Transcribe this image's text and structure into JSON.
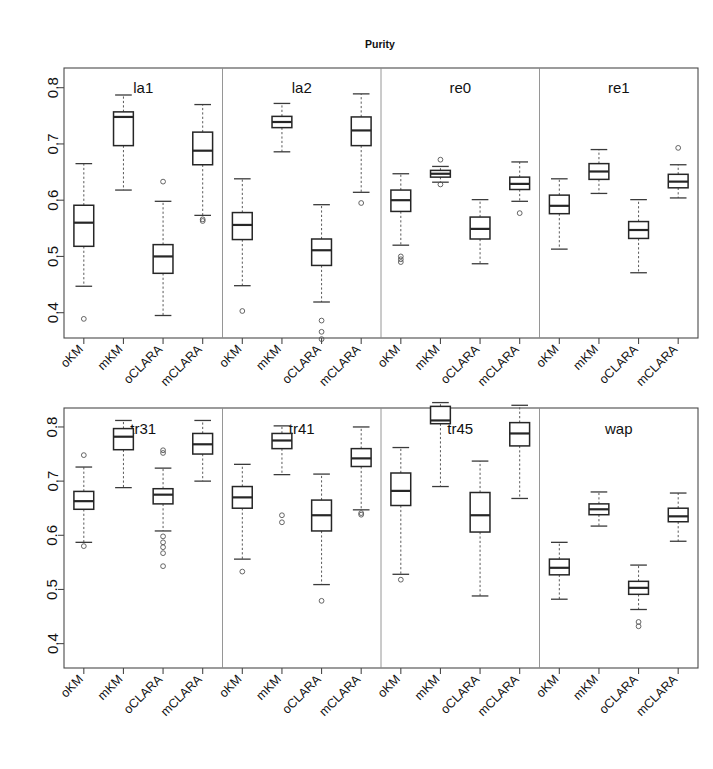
{
  "chart_data": {
    "type": "box",
    "title": "Purity",
    "xlabel": "",
    "ylabel": "",
    "ylim": [
      0.355,
      0.835
    ],
    "yticks": [
      0.4,
      0.5,
      0.6,
      0.7,
      0.8
    ],
    "ytick_labels": [
      "0.4",
      "0.5",
      "0.6",
      "0.7",
      "0.8"
    ],
    "grid": false,
    "legend": "none",
    "methods": [
      "oKM",
      "mKM",
      "oCLARA",
      "mCLARA"
    ],
    "panels": [
      {
        "row": 0,
        "groups": [
          {
            "name": "la1",
            "boxes": [
              {
                "method": "oKM",
                "whisker_low": 0.447,
                "q1": 0.518,
                "median": 0.56,
                "q3": 0.591,
                "whisker_high": 0.665,
                "outliers": [
                  0.389
                ]
              },
              {
                "method": "mKM",
                "whisker_low": 0.618,
                "q1": 0.697,
                "median": 0.748,
                "q3": 0.757,
                "whisker_high": 0.787,
                "outliers": []
              },
              {
                "method": "oCLARA",
                "whisker_low": 0.395,
                "q1": 0.47,
                "median": 0.5,
                "q3": 0.521,
                "whisker_high": 0.598,
                "outliers": [
                  0.633
                ]
              },
              {
                "method": "mCLARA",
                "whisker_low": 0.573,
                "q1": 0.663,
                "median": 0.688,
                "q3": 0.721,
                "whisker_high": 0.77,
                "outliers": [
                  0.566,
                  0.563
                ]
              }
            ]
          },
          {
            "name": "la2",
            "boxes": [
              {
                "method": "oKM",
                "whisker_low": 0.448,
                "q1": 0.53,
                "median": 0.556,
                "q3": 0.578,
                "whisker_high": 0.638,
                "outliers": [
                  0.403
                ]
              },
              {
                "method": "mKM",
                "whisker_low": 0.686,
                "q1": 0.729,
                "median": 0.739,
                "q3": 0.749,
                "whisker_high": 0.772,
                "outliers": []
              },
              {
                "method": "oCLARA",
                "whisker_low": 0.419,
                "q1": 0.484,
                "median": 0.511,
                "q3": 0.531,
                "whisker_high": 0.592,
                "outliers": [
                  0.386,
                  0.366,
                  0.353
                ]
              },
              {
                "method": "mCLARA",
                "whisker_low": 0.614,
                "q1": 0.697,
                "median": 0.724,
                "q3": 0.748,
                "whisker_high": 0.789,
                "outliers": [
                  0.595
                ]
              }
            ]
          },
          {
            "name": "re0",
            "boxes": [
              {
                "method": "oKM",
                "whisker_low": 0.52,
                "q1": 0.58,
                "median": 0.6,
                "q3": 0.618,
                "whisker_high": 0.647,
                "outliers": [
                  0.5,
                  0.495,
                  0.49
                ]
              },
              {
                "method": "mKM",
                "whisker_low": 0.632,
                "q1": 0.641,
                "median": 0.647,
                "q3": 0.653,
                "whisker_high": 0.66,
                "outliers": [
                  0.672,
                  0.628
                ]
              },
              {
                "method": "oCLARA",
                "whisker_low": 0.487,
                "q1": 0.531,
                "median": 0.549,
                "q3": 0.57,
                "whisker_high": 0.601,
                "outliers": []
              },
              {
                "method": "mCLARA",
                "whisker_low": 0.598,
                "q1": 0.619,
                "median": 0.629,
                "q3": 0.641,
                "whisker_high": 0.668,
                "outliers": [
                  0.577
                ]
              }
            ]
          },
          {
            "name": "re1",
            "boxes": [
              {
                "method": "oKM",
                "whisker_low": 0.513,
                "q1": 0.576,
                "median": 0.59,
                "q3": 0.609,
                "whisker_high": 0.638,
                "outliers": []
              },
              {
                "method": "mKM",
                "whisker_low": 0.612,
                "q1": 0.637,
                "median": 0.651,
                "q3": 0.665,
                "whisker_high": 0.69,
                "outliers": []
              },
              {
                "method": "oCLARA",
                "whisker_low": 0.471,
                "q1": 0.532,
                "median": 0.547,
                "q3": 0.562,
                "whisker_high": 0.601,
                "outliers": []
              },
              {
                "method": "mCLARA",
                "whisker_low": 0.604,
                "q1": 0.622,
                "median": 0.633,
                "q3": 0.646,
                "whisker_high": 0.663,
                "outliers": [
                  0.693
                ]
              }
            ]
          }
        ]
      },
      {
        "row": 1,
        "groups": [
          {
            "name": "tr31",
            "boxes": [
              {
                "method": "oKM",
                "whisker_low": 0.587,
                "q1": 0.648,
                "median": 0.663,
                "q3": 0.681,
                "whisker_high": 0.726,
                "outliers": [
                  0.748,
                  0.58
                ]
              },
              {
                "method": "mKM",
                "whisker_low": 0.688,
                "q1": 0.758,
                "median": 0.782,
                "q3": 0.797,
                "whisker_high": 0.812,
                "outliers": []
              },
              {
                "method": "oCLARA",
                "whisker_low": 0.608,
                "q1": 0.658,
                "median": 0.675,
                "q3": 0.686,
                "whisker_high": 0.724,
                "outliers": [
                  0.757,
                  0.752,
                  0.598,
                  0.587,
                  0.578,
                  0.567,
                  0.543
                ]
              },
              {
                "method": "mCLARA",
                "whisker_low": 0.7,
                "q1": 0.75,
                "median": 0.768,
                "q3": 0.788,
                "whisker_high": 0.812,
                "outliers": []
              }
            ]
          },
          {
            "name": "tr41",
            "boxes": [
              {
                "method": "oKM",
                "whisker_low": 0.556,
                "q1": 0.65,
                "median": 0.67,
                "q3": 0.69,
                "whisker_high": 0.731,
                "outliers": [
                  0.533
                ]
              },
              {
                "method": "mKM",
                "whisker_low": 0.712,
                "q1": 0.76,
                "median": 0.775,
                "q3": 0.788,
                "whisker_high": 0.802,
                "outliers": [
                  0.637,
                  0.624
                ]
              },
              {
                "method": "oCLARA",
                "whisker_low": 0.509,
                "q1": 0.608,
                "median": 0.637,
                "q3": 0.665,
                "whisker_high": 0.713,
                "outliers": [
                  0.479
                ]
              },
              {
                "method": "mCLARA",
                "whisker_low": 0.647,
                "q1": 0.727,
                "median": 0.742,
                "q3": 0.76,
                "whisker_high": 0.8,
                "outliers": [
                  0.641,
                  0.638
                ]
              }
            ]
          },
          {
            "name": "tr45",
            "boxes": [
              {
                "method": "oKM",
                "whisker_low": 0.528,
                "q1": 0.655,
                "median": 0.682,
                "q3": 0.715,
                "whisker_high": 0.762,
                "outliers": [
                  0.518
                ]
              },
              {
                "method": "mKM",
                "whisker_low": 0.69,
                "q1": 0.806,
                "median": 0.812,
                "q3": 0.838,
                "whisker_high": 0.845,
                "outliers": []
              },
              {
                "method": "oCLARA",
                "whisker_low": 0.488,
                "q1": 0.606,
                "median": 0.637,
                "q3": 0.679,
                "whisker_high": 0.737,
                "outliers": []
              },
              {
                "method": "mCLARA",
                "whisker_low": 0.668,
                "q1": 0.765,
                "median": 0.788,
                "q3": 0.808,
                "whisker_high": 0.84,
                "outliers": []
              }
            ]
          },
          {
            "name": "wap",
            "boxes": [
              {
                "method": "oKM",
                "whisker_low": 0.482,
                "q1": 0.527,
                "median": 0.54,
                "q3": 0.556,
                "whisker_high": 0.587,
                "outliers": []
              },
              {
                "method": "mKM",
                "whisker_low": 0.617,
                "q1": 0.638,
                "median": 0.648,
                "q3": 0.658,
                "whisker_high": 0.68,
                "outliers": []
              },
              {
                "method": "oCLARA",
                "whisker_low": 0.463,
                "q1": 0.491,
                "median": 0.503,
                "q3": 0.515,
                "whisker_high": 0.545,
                "outliers": [
                  0.44,
                  0.432
                ]
              },
              {
                "method": "mCLARA",
                "whisker_low": 0.589,
                "q1": 0.625,
                "median": 0.635,
                "q3": 0.65,
                "whisker_high": 0.678,
                "outliers": []
              }
            ]
          }
        ]
      }
    ]
  }
}
